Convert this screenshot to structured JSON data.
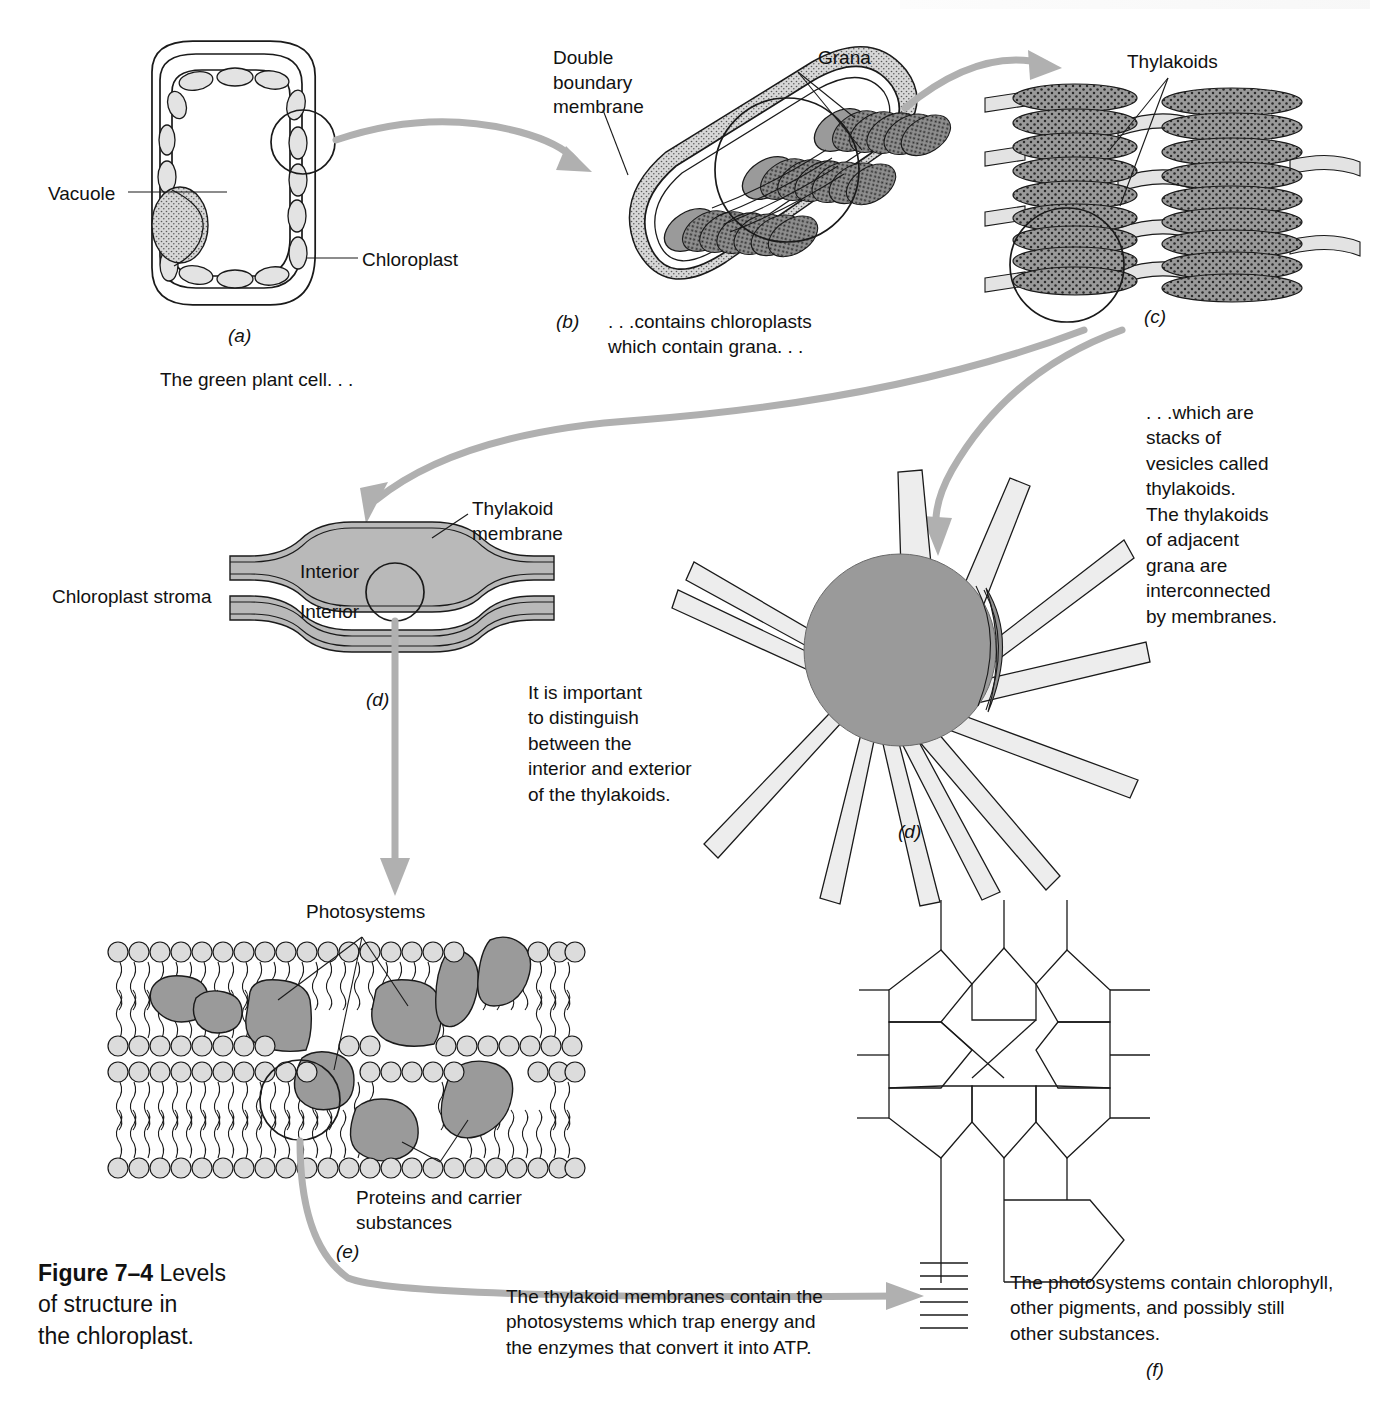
{
  "figure": {
    "caption_bold": "Figure 7–4",
    "caption_rest": "  Levels\nof structure in\nthe chloroplast."
  },
  "panels": {
    "a": {
      "key": "(a)",
      "subtitle": "The green plant cell. . .",
      "labels": {
        "vacuole": "Vacuole",
        "chloroplast": "Chloroplast"
      }
    },
    "b": {
      "key": "(b)",
      "subtitle": ". . .contains chloroplasts\nwhich contain grana. . .",
      "labels": {
        "membrane": "Double\nboundary\nmembrane",
        "grana": "Grana"
      }
    },
    "c": {
      "key": "(c)",
      "labels": {
        "thylakoids": "Thylakoids"
      },
      "note": ". . .which are\nstacks of\nvesicles called\nthylakoids.\nThe thylakoids\nof adjacent\ngrana are\ninterconnected\nby membranes."
    },
    "d_left": {
      "key": "(d)",
      "labels": {
        "stroma": "Chloroplast stroma",
        "membrane": "Thylakoid\nmembrane",
        "interior_top": "Interior",
        "interior_bottom": "Interior"
      },
      "note": "It is important\nto distinguish\nbetween the\ninterior and exterior\nof the thylakoids."
    },
    "d_right": {
      "key": "(d)"
    },
    "e": {
      "key": "(e)",
      "labels": {
        "photosystems": "Photosystems",
        "proteins": "Proteins and carrier\nsubstances"
      },
      "note": "The thylakoid membranes contain the\nphotosystems which trap energy and\nthe enzymes that convert it into ATP."
    },
    "f": {
      "key": "(f)",
      "note": "The photosystems contain chlorophyll,\nother pigments, and possibly still\nother substances."
    }
  },
  "colors": {
    "ink": "#1a1a1a",
    "arrow_gray": "#b0b0b0",
    "thylakoid_gray": "#9a9a9a",
    "membrane_light": "#e3e3e3",
    "protein_gray": "#9a9a9a",
    "page_background": "#ffffff"
  }
}
